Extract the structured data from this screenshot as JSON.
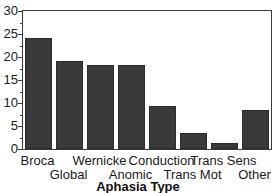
{
  "chart_data": {
    "type": "bar",
    "title": "",
    "subtitle": "",
    "xlabel": "Aphasia Type",
    "ylabel": "",
    "categories": [
      "Broca",
      "Global",
      "Wernicke",
      "Anomic",
      "Conduction",
      "Trans Mot",
      "Trans Sens",
      "Other"
    ],
    "values": [
      24.2,
      19.2,
      18.2,
      18.2,
      9.4,
      3.4,
      1.4,
      8.4
    ],
    "series": [
      {
        "name": "Percent",
        "values": [
          24.2,
          19.2,
          18.2,
          18.2,
          9.4,
          3.4,
          1.4,
          8.4
        ]
      }
    ],
    "ylim": [
      0,
      30
    ],
    "xlim": [
      0,
      8
    ],
    "ytick_labels": [
      "0",
      "5",
      "10",
      "15",
      "20",
      "25",
      "30"
    ],
    "ytick_values": [
      0,
      5,
      10,
      15,
      20,
      25,
      30
    ],
    "yminor_step": 2.5,
    "grid": false,
    "legend": false,
    "legend_position": "none",
    "bar_color": "#3a3a3a",
    "bar_edge_color": "#2b2b2b",
    "frame_color": "#3c3c3c",
    "label_stagger": [
      "top",
      "bottom",
      "top",
      "bottom",
      "top",
      "bottom",
      "top",
      "bottom"
    ],
    "annotations": []
  },
  "axes": {
    "y": {
      "ticks": [
        {
          "label": "30",
          "value": 30
        },
        {
          "label": "25",
          "value": 25
        },
        {
          "label": "20",
          "value": 20
        },
        {
          "label": "15",
          "value": 15
        },
        {
          "label": "10",
          "value": 10
        },
        {
          "label": "5",
          "value": 5
        },
        {
          "label": "0",
          "value": 0
        }
      ]
    },
    "x": {
      "title": "Aphasia Type",
      "ticks": [
        {
          "label": "Broca",
          "row": "top"
        },
        {
          "label": "Global",
          "row": "bottom"
        },
        {
          "label": "Wernicke",
          "row": "top"
        },
        {
          "label": "Anomic",
          "row": "bottom"
        },
        {
          "label": "Conduction",
          "row": "top"
        },
        {
          "label": "Trans Mot",
          "row": "bottom"
        },
        {
          "label": "Trans Sens",
          "row": "top"
        },
        {
          "label": "Other",
          "row": "bottom"
        }
      ]
    }
  }
}
